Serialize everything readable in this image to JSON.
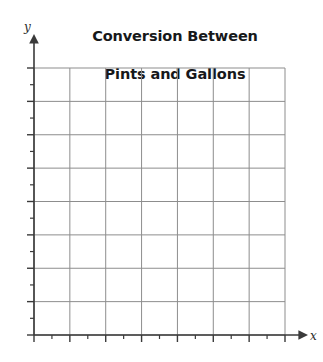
{
  "title": {
    "line1": "Conversion Between",
    "line2": "Pints and Gallons"
  },
  "axes": {
    "y_label": "y",
    "x_label": "x"
  },
  "chart_data": {
    "type": "line",
    "title": "Conversion Between Pints and Gallons",
    "subtitle": "",
    "xlabel": "x",
    "ylabel": "y",
    "series": [],
    "categories": [],
    "values": [],
    "grid": true,
    "grid_columns": 7,
    "grid_rows": 8,
    "legend": "none",
    "xlim": [
      0,
      7
    ],
    "ylim": [
      0,
      8
    ],
    "x_major_ticks": [
      0,
      1,
      2,
      3,
      4,
      5,
      6,
      7
    ],
    "x_minor_ticks": [
      0.5,
      1.5,
      2.5,
      3.5,
      4.5,
      5.5,
      6.5
    ],
    "y_major_ticks": [
      0,
      1,
      2,
      3,
      4,
      5,
      6,
      7,
      8
    ],
    "y_minor_ticks": [
      0.5,
      1.5,
      2.5,
      3.5,
      4.5,
      5.5,
      6.5,
      7.5
    ],
    "x_tick_labels": [],
    "y_tick_labels": [],
    "annotations": [],
    "note": "Blank coordinate grid; no data plotted."
  },
  "style": {
    "grid_color": "#8d8d8d",
    "axis_color": "#3a3a3a",
    "title_color": "#17181a",
    "background": "#ffffff"
  },
  "geometry": {
    "plot_left": 34,
    "plot_right": 285,
    "plot_top": 68,
    "plot_bottom": 335,
    "cell_width": 35.86,
    "cell_height": 33.38
  }
}
